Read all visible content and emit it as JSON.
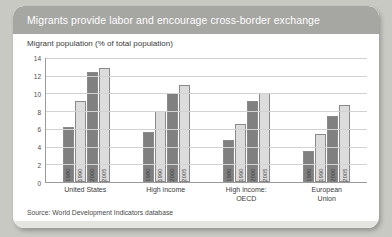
{
  "card": {
    "title": "Migrants provide labor and encourage cross-border exchange",
    "subtitle": "Migrant population (% of total population)",
    "source": "Source: World Development Indicators database"
  },
  "colors": {
    "header_bg": "#a6a6a3",
    "bar_dark": "#808080",
    "bar_light": "#dcdcdc",
    "page_bg": "#c9c9c4",
    "card_bg": "#ffffff"
  },
  "chart_data": {
    "type": "bar",
    "title": "Migrants provide labor and encourage cross-border exchange",
    "subtitle": "Migrant population (% of total population)",
    "xlabel": "",
    "ylabel": "",
    "ylim": [
      0,
      14
    ],
    "yticks": [
      0,
      2,
      4,
      6,
      8,
      10,
      12,
      14
    ],
    "grid": true,
    "legend": "none",
    "categories": [
      "United States",
      "High income",
      "High income: OECD",
      "European Union"
    ],
    "category_lines": [
      [
        "United States"
      ],
      [
        "High income"
      ],
      [
        "High income:",
        "OECD"
      ],
      [
        "European",
        "Union"
      ]
    ],
    "series": [
      {
        "name": "1980",
        "values": [
          6.2,
          5.6,
          4.7,
          3.5
        ]
      },
      {
        "name": "1990",
        "values": [
          9.1,
          8.0,
          6.5,
          5.4
        ]
      },
      {
        "name": "2000",
        "values": [
          12.4,
          10.0,
          9.2,
          7.5
        ]
      },
      {
        "name": "2005",
        "values": [
          12.9,
          11.0,
          10.0,
          8.7
        ]
      }
    ],
    "source": "Source: World Development Indicators database"
  }
}
